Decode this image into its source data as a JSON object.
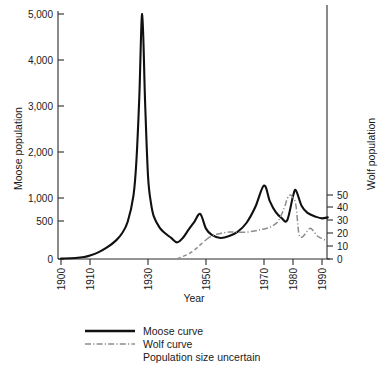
{
  "chart_data": {
    "type": "line",
    "title": "",
    "xlabel": "Year",
    "ylabel": "Moose population",
    "y2label": "Wolf population",
    "xlim": [
      1900,
      1993
    ],
    "ylim": [
      0,
      5000
    ],
    "y2lim": [
      0,
      55
    ],
    "grid": false,
    "legend_position": "below-center",
    "x_ticks": [
      1900,
      1910,
      1930,
      1950,
      1970,
      1980,
      1990
    ],
    "x_tick_labels": [
      "1900",
      "1910",
      "1930",
      "1950",
      "1970",
      "1980",
      "1990"
    ],
    "y_ticks": [
      0,
      500,
      1000,
      2000,
      3000,
      4000,
      5000
    ],
    "y_tick_labels": [
      "0",
      "500",
      "1,000",
      "2,000",
      "3,000",
      "4,000",
      "5,000"
    ],
    "y2_ticks": [
      0,
      10,
      20,
      30,
      40,
      50
    ],
    "y2_tick_labels": [
      "0",
      "10",
      "20",
      "30",
      "40",
      "50"
    ],
    "series": [
      {
        "name": "Moose curve",
        "axis": "left",
        "style": "solid",
        "color": "#101010",
        "x": [
          1900,
          1905,
          1908,
          1910,
          1913,
          1916,
          1919,
          1921,
          1923,
          1925,
          1926,
          1927,
          1928,
          1929,
          1930,
          1931,
          1932,
          1934,
          1936,
          1938,
          1940,
          1942,
          1944,
          1946,
          1948,
          1950,
          1952,
          1955,
          1958,
          1961,
          1964,
          1967,
          1970,
          1972,
          1974,
          1976,
          1978,
          1980,
          1981,
          1983,
          1985,
          1988,
          1990,
          1992
        ],
        "y": [
          10,
          20,
          40,
          70,
          140,
          240,
          380,
          520,
          760,
          1300,
          2000,
          3300,
          5000,
          3200,
          1700,
          1150,
          870,
          640,
          520,
          430,
          340,
          430,
          600,
          760,
          920,
          620,
          490,
          430,
          470,
          560,
          740,
          1060,
          1500,
          1180,
          960,
          840,
          790,
          1280,
          1400,
          1080,
          940,
          860,
          830,
          850
        ]
      },
      {
        "name": "Wolf curve",
        "axis": "right",
        "style": "dash-dot",
        "color": "#8d8d8d",
        "uncertain_until": 1950,
        "x": [
          1940,
          1942,
          1944,
          1946,
          1948,
          1950,
          1952,
          1955,
          1958,
          1961,
          1964,
          1967,
          1969,
          1971,
          1973,
          1975,
          1977,
          1978,
          1979,
          1980,
          1981,
          1982,
          1983,
          1984,
          1985,
          1986,
          1987,
          1988,
          1989,
          1990,
          1991,
          1992
        ],
        "y": [
          0,
          2,
          4,
          7,
          11,
          15,
          18,
          20,
          21,
          21,
          21,
          22,
          23,
          24,
          26,
          30,
          40,
          47,
          50,
          48,
          42,
          20,
          17,
          19,
          22,
          24,
          22,
          19,
          17,
          16,
          15,
          15
        ]
      }
    ],
    "annotations": []
  },
  "legend": {
    "items": [
      {
        "label": "Moose curve",
        "style": "solid",
        "color": "#101010"
      },
      {
        "label": "Wolf curve",
        "style": "dash-dot",
        "color": "#8d8d8d"
      }
    ],
    "note": "Population size uncertain"
  },
  "colors": {
    "moose": "#101010",
    "wolf": "#8d8d8d",
    "axis": "#2b2b2b",
    "background": "#ffffff"
  }
}
